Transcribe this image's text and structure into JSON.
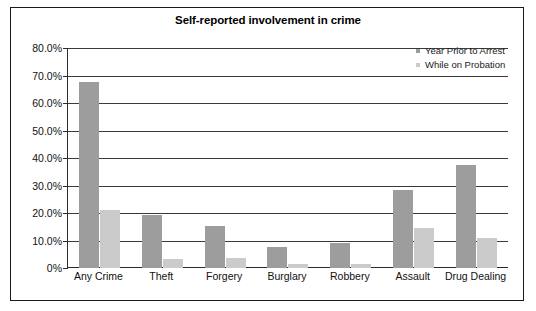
{
  "chart_data": {
    "type": "bar",
    "title": "Self-reported involvement in crime",
    "xlabel": "",
    "ylabel": "",
    "ylim": [
      0,
      80
    ],
    "grid": true,
    "legend_position": "top-right",
    "categories": [
      "Any Crime",
      "Theft",
      "Forgery",
      "Burglary",
      "Robbery",
      "Assault",
      "Drug Dealing"
    ],
    "ytick_labels": [
      "80.0%",
      "70.0%",
      "60.0%",
      "50.0%",
      "40.0%",
      "30.0%",
      "20.0%",
      "10.0%",
      "0%"
    ],
    "ytick_values": [
      80,
      70,
      60,
      50,
      40,
      30,
      20,
      10,
      0
    ],
    "series": [
      {
        "name": "Year Prior to Arrest",
        "color": "#9d9d9d",
        "values": [
          67.8,
          19.3,
          15.4,
          7.5,
          9.0,
          28.5,
          37.6
        ]
      },
      {
        "name": "While on Probation",
        "color": "#cbcbcb",
        "values": [
          21.0,
          3.2,
          3.8,
          1.3,
          1.5,
          14.5,
          10.8
        ]
      }
    ]
  }
}
